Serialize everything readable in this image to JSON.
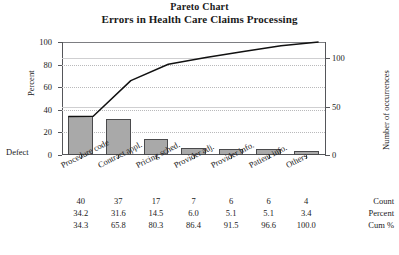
{
  "chart_data": {
    "type": "bar",
    "title": "Pareto Chart",
    "subtitle": "Errors in Health Care Claims Processing",
    "xlabel": "Defect",
    "ylabel": "Percent",
    "ylabel_right": "Number of occurrences",
    "grid": true,
    "legend": "none",
    "categories": [
      "Procedure code",
      "Contract appl.",
      "Pricing sched.",
      "Provider adj.",
      "Provider info.",
      "Patient info.",
      "Others"
    ],
    "series": [
      {
        "name": "Count",
        "values": [
          40,
          37,
          17,
          7,
          6,
          6,
          4
        ]
      },
      {
        "name": "Percent",
        "values": [
          34.2,
          31.6,
          14.5,
          6.0,
          5.1,
          5.1,
          3.4
        ]
      },
      {
        "name": "Cum %",
        "values": [
          34.3,
          65.8,
          80.3,
          86.4,
          91.5,
          96.6,
          100.0
        ]
      }
    ],
    "values": [
      34.2,
      31.6,
      14.5,
      6.0,
      5.1,
      5.1,
      3.4
    ],
    "cumulative": [
      34.3,
      65.8,
      80.3,
      86.4,
      91.5,
      96.6,
      100.0
    ],
    "ylim": [
      0,
      100
    ],
    "yticks": [
      0,
      20,
      40,
      60,
      80,
      100
    ],
    "ylim_right": [
      0,
      117
    ],
    "yticks_right": [
      0,
      50,
      100
    ],
    "total_count": 117,
    "bar_color": "#a9a9a9",
    "line_color": "#111111"
  },
  "axes": {
    "left_title": "Percent",
    "right_title": "Number of occurrences",
    "left_ticks": [
      "0",
      "20",
      "40",
      "60",
      "80",
      "100"
    ],
    "right_ticks": [
      "0",
      "50",
      "100"
    ],
    "defect_label": "Defect"
  },
  "table": {
    "rows": [
      {
        "label": "Count",
        "values": [
          "40",
          "37",
          "17",
          "7",
          "6",
          "6",
          "4"
        ]
      },
      {
        "label": "Percent",
        "values": [
          "34.2",
          "31.6",
          "14.5",
          "6.0",
          "5.1",
          "5.1",
          "3.4"
        ]
      },
      {
        "label": "Cum %",
        "values": [
          "34.3",
          "65.8",
          "80.3",
          "86.4",
          "91.5",
          "96.6",
          "100.0"
        ]
      }
    ]
  },
  "categories": [
    "Procedure code",
    "Contract appl.",
    "Pricing sched.",
    "Provider adj.",
    "Provider info.",
    "Patient info.",
    "Others"
  ]
}
